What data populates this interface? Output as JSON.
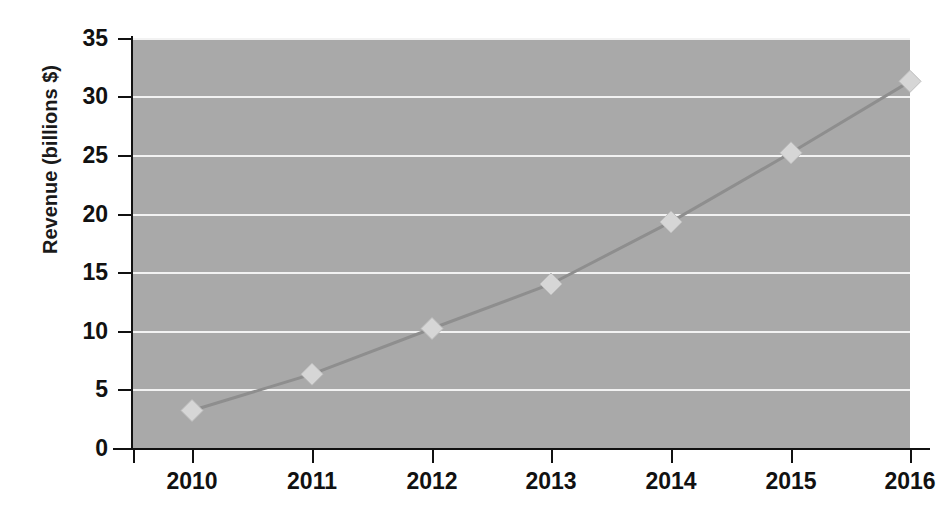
{
  "chart_data": {
    "type": "line",
    "title": "",
    "subtitle": "",
    "xlabel": "",
    "ylabel": "Revenue (billions $)",
    "categories": [
      "2010",
      "2011",
      "2012",
      "2013",
      "2014",
      "2015",
      "2016"
    ],
    "x": [
      2010,
      2011,
      2012,
      2013,
      2014,
      2015,
      2016
    ],
    "values": [
      3.2,
      6.3,
      10.2,
      14.0,
      19.3,
      25.2,
      31.3
    ],
    "series": [
      {
        "name": "Revenue",
        "values": [
          3.2,
          6.3,
          10.2,
          14.0,
          19.3,
          25.2,
          31.3
        ]
      }
    ],
    "ylim": [
      0,
      35
    ],
    "xlim": [
      2009.6,
      2016.4
    ],
    "ytick_labels": [
      "0",
      "5",
      "10",
      "15",
      "20",
      "25",
      "30",
      "35"
    ],
    "ytick_values": [
      0,
      5,
      10,
      15,
      20,
      25,
      30,
      35
    ],
    "xtick_labels": [
      "2010",
      "2011",
      "2012",
      "2013",
      "2014",
      "2015",
      "2016"
    ],
    "grid": "horizontal",
    "legend": "none",
    "marker": "diamond",
    "annotations": []
  },
  "style": {
    "plot_background": "#a9a9a9",
    "page_background": "#ffffff",
    "gridline_color": "#f2f2f2",
    "axis_color": "#111111",
    "series_line_color": "#8e8e8e",
    "marker_fill": "#d6d6d6",
    "marker_stroke": "#bdbdbd",
    "text_color": "#111111"
  }
}
